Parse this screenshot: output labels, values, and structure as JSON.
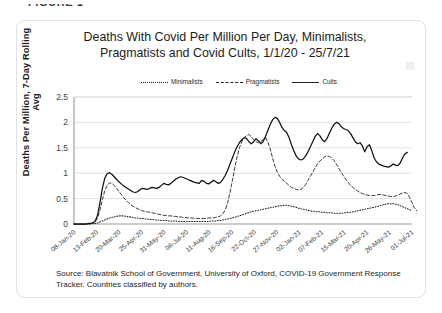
{
  "figure_label": "FIGURE 1",
  "chart": {
    "title_line1": "Deaths With Covid Per Million Per Day, Minimalists,",
    "title_line2": "Pragmatists and Covid Cults, 1/1/20 - 25/7/21"
  },
  "source": {
    "line1": "Source: Blavatnik School of Government, University of Oxford, COVID-19 Government",
    "line2": "Response Tracker. Countries classified by authors."
  },
  "chart_data": {
    "type": "line",
    "title": "Deaths With Covid Per Million Per Day, Minimalists, Pragmatists and Covid Cults, 1/1/20 - 25/7/21",
    "xlabel": "",
    "ylabel": "Deaths Per Million, 7-Day Rolling Avg",
    "ylim": [
      0,
      2.5
    ],
    "yticks": [
      0,
      0.5,
      1,
      1.5,
      2,
      2.5
    ],
    "ytick_labels": [
      "0",
      "0.5",
      "1",
      "1.5",
      "2",
      "2.5"
    ],
    "grid": "horizontal",
    "legend_position": "top-center",
    "xtick_labels": [
      "08-Jan-20",
      "13-Feb-20",
      "20-Mar-20",
      "25-Apr-20",
      "31-May-20",
      "06-Jul-20",
      "11-Aug-20",
      "16-Sep-20",
      "22-Oct-20",
      "27-Nov-20",
      "02-Jan-21",
      "07-Feb-21",
      "15-Mar-21",
      "20-Apr-21",
      "26-May-21",
      "01-Jul-21"
    ],
    "x_range": [
      "1/1/20",
      "25/7/21"
    ],
    "series": [
      {
        "name": "Minimalists",
        "style": "dotted",
        "color": "#222222",
        "values": [
          0.0,
          0.0,
          0.0,
          0.0,
          0.0,
          0.0,
          0.0,
          0.0,
          0.01,
          0.01,
          0.02,
          0.04,
          0.06,
          0.08,
          0.1,
          0.12,
          0.13,
          0.14,
          0.15,
          0.16,
          0.16,
          0.16,
          0.15,
          0.14,
          0.14,
          0.13,
          0.12,
          0.12,
          0.11,
          0.11,
          0.1,
          0.1,
          0.09,
          0.09,
          0.08,
          0.08,
          0.08,
          0.07,
          0.07,
          0.07,
          0.06,
          0.06,
          0.06,
          0.06,
          0.05,
          0.05,
          0.05,
          0.05,
          0.05,
          0.05,
          0.05,
          0.05,
          0.05,
          0.05,
          0.05,
          0.05,
          0.05,
          0.05,
          0.06,
          0.06,
          0.06,
          0.07,
          0.07,
          0.08,
          0.09,
          0.1,
          0.11,
          0.12,
          0.13,
          0.15,
          0.16,
          0.18,
          0.19,
          0.21,
          0.22,
          0.24,
          0.25,
          0.26,
          0.27,
          0.28,
          0.29,
          0.3,
          0.31,
          0.32,
          0.33,
          0.34,
          0.35,
          0.36,
          0.36,
          0.37,
          0.37,
          0.36,
          0.35,
          0.34,
          0.33,
          0.31,
          0.3,
          0.29,
          0.28,
          0.27,
          0.26,
          0.25,
          0.25,
          0.24,
          0.24,
          0.23,
          0.23,
          0.22,
          0.22,
          0.22,
          0.21,
          0.21,
          0.21,
          0.21,
          0.22,
          0.22,
          0.23,
          0.23,
          0.24,
          0.25,
          0.26,
          0.27,
          0.28,
          0.29,
          0.3,
          0.31,
          0.32,
          0.33,
          0.34,
          0.35,
          0.37,
          0.38,
          0.39,
          0.4,
          0.4,
          0.4,
          0.39,
          0.38,
          0.36,
          0.34,
          0.32,
          0.3,
          0.28,
          0.26
        ]
      },
      {
        "name": "Pragmatists",
        "style": "dashed",
        "color": "#3a3a3a",
        "values": [
          0.0,
          0.0,
          0.0,
          0.0,
          0.0,
          0.0,
          0.0,
          0.01,
          0.02,
          0.05,
          0.12,
          0.28,
          0.48,
          0.65,
          0.76,
          0.81,
          0.8,
          0.76,
          0.7,
          0.64,
          0.58,
          0.52,
          0.47,
          0.42,
          0.38,
          0.35,
          0.32,
          0.3,
          0.28,
          0.26,
          0.25,
          0.24,
          0.23,
          0.22,
          0.21,
          0.2,
          0.19,
          0.18,
          0.17,
          0.17,
          0.16,
          0.16,
          0.15,
          0.15,
          0.14,
          0.14,
          0.13,
          0.13,
          0.12,
          0.12,
          0.12,
          0.11,
          0.11,
          0.11,
          0.11,
          0.11,
          0.11,
          0.12,
          0.12,
          0.12,
          0.13,
          0.14,
          0.16,
          0.2,
          0.28,
          0.42,
          0.62,
          0.85,
          1.1,
          1.32,
          1.5,
          1.62,
          1.7,
          1.74,
          1.76,
          1.72,
          1.66,
          1.62,
          1.6,
          1.62,
          1.66,
          1.7,
          1.62,
          1.48,
          1.3,
          1.14,
          1.02,
          0.94,
          0.88,
          0.84,
          0.8,
          0.76,
          0.72,
          0.7,
          0.68,
          0.67,
          0.68,
          0.72,
          0.78,
          0.86,
          0.94,
          1.02,
          1.1,
          1.18,
          1.24,
          1.28,
          1.32,
          1.34,
          1.33,
          1.3,
          1.25,
          1.18,
          1.1,
          1.02,
          0.95,
          0.88,
          0.82,
          0.76,
          0.72,
          0.68,
          0.65,
          0.62,
          0.6,
          0.58,
          0.57,
          0.56,
          0.56,
          0.56,
          0.57,
          0.58,
          0.58,
          0.57,
          0.56,
          0.55,
          0.54,
          0.54,
          0.55,
          0.57,
          0.59,
          0.61,
          0.62,
          0.6,
          0.52,
          0.42,
          0.32,
          0.26
        ]
      },
      {
        "name": "Cults",
        "style": "solid",
        "color": "#111111",
        "values": [
          0.0,
          0.0,
          0.0,
          0.0,
          0.0,
          0.0,
          0.01,
          0.01,
          0.02,
          0.06,
          0.18,
          0.42,
          0.7,
          0.9,
          0.99,
          1.01,
          0.98,
          0.93,
          0.88,
          0.83,
          0.79,
          0.75,
          0.72,
          0.69,
          0.66,
          0.63,
          0.62,
          0.64,
          0.68,
          0.7,
          0.69,
          0.68,
          0.7,
          0.72,
          0.71,
          0.7,
          0.72,
          0.76,
          0.8,
          0.78,
          0.77,
          0.8,
          0.84,
          0.88,
          0.91,
          0.93,
          0.92,
          0.9,
          0.88,
          0.86,
          0.84,
          0.82,
          0.81,
          0.8,
          0.86,
          0.84,
          0.8,
          0.79,
          0.82,
          0.86,
          0.83,
          0.8,
          0.82,
          0.88,
          0.96,
          1.06,
          1.18,
          1.3,
          1.42,
          1.52,
          1.6,
          1.66,
          1.7,
          1.68,
          1.62,
          1.58,
          1.62,
          1.68,
          1.64,
          1.58,
          1.62,
          1.72,
          1.84,
          1.96,
          2.05,
          2.1,
          2.08,
          2.0,
          1.9,
          1.84,
          1.8,
          1.7,
          1.56,
          1.44,
          1.34,
          1.28,
          1.26,
          1.28,
          1.34,
          1.42,
          1.52,
          1.62,
          1.72,
          1.78,
          1.74,
          1.66,
          1.62,
          1.68,
          1.78,
          1.88,
          1.96,
          2.0,
          1.98,
          1.92,
          1.88,
          1.86,
          1.84,
          1.78,
          1.7,
          1.62,
          1.58,
          1.6,
          1.54,
          1.42,
          1.52,
          1.56,
          1.44,
          1.3,
          1.22,
          1.18,
          1.16,
          1.14,
          1.13,
          1.12,
          1.14,
          1.18,
          1.16,
          1.15,
          1.2,
          1.3,
          1.38,
          1.41
        ]
      }
    ]
  }
}
